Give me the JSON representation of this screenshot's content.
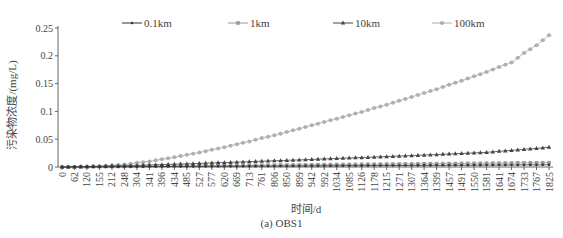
{
  "chart_data": {
    "type": "line",
    "title": "",
    "caption": "(a) OBS1",
    "xlabel": "时间/d",
    "ylabel": "污染物浓度/(mg/L)",
    "ylim": [
      0,
      0.25
    ],
    "yticks": [
      "0",
      "0.05",
      "0.1",
      "0.15",
      "0.2",
      "0.25"
    ],
    "grid": false,
    "legend_position": "top",
    "x": [
      "0",
      "62",
      "120",
      "155",
      "212",
      "248",
      "304",
      "341",
      "396",
      "434",
      "485",
      "527",
      "577",
      "620",
      "669",
      "713",
      "761",
      "806",
      "850",
      "899",
      "942",
      "992",
      "1034",
      "1085",
      "1126",
      "1178",
      "1215",
      "1271",
      "1307",
      "1364",
      "1399",
      "1457",
      "1491",
      "1550",
      "1581",
      "1641",
      "1674",
      "1733",
      "1767",
      "1825"
    ],
    "series": [
      {
        "name": "0.1km",
        "marker": "dot",
        "color": "#333333",
        "values": [
          0,
          0.0001,
          0.0002,
          0.0003,
          0.0004,
          0.0005,
          0.0006,
          0.0007,
          0.0008,
          0.0009,
          0.001,
          0.0011,
          0.0012,
          0.0013,
          0.0014,
          0.0015,
          0.0016,
          0.0017,
          0.0018,
          0.0019,
          0.002,
          0.0021,
          0.0022,
          0.0023,
          0.0024,
          0.0025,
          0.0026,
          0.0027,
          0.0028,
          0.0029,
          0.003,
          0.0031,
          0.0032,
          0.0033,
          0.0034,
          0.0035,
          0.0036,
          0.0037,
          0.0038,
          0.0039
        ]
      },
      {
        "name": "1km",
        "marker": "square",
        "color": "#999999",
        "values": [
          0,
          0.0002,
          0.0004,
          0.0006,
          0.0008,
          0.001,
          0.0012,
          0.0014,
          0.0016,
          0.0018,
          0.002,
          0.0022,
          0.0024,
          0.0026,
          0.0028,
          0.003,
          0.0032,
          0.0034,
          0.0036,
          0.0038,
          0.004,
          0.0042,
          0.0044,
          0.0046,
          0.0048,
          0.005,
          0.0052,
          0.0054,
          0.0056,
          0.0058,
          0.006,
          0.0062,
          0.0064,
          0.0066,
          0.0068,
          0.007,
          0.0072,
          0.0074,
          0.0076,
          0.0078
        ]
      },
      {
        "name": "10km",
        "marker": "triangle",
        "color": "#444444",
        "values": [
          0,
          0.0003,
          0.0008,
          0.0012,
          0.0018,
          0.0023,
          0.003,
          0.0036,
          0.0043,
          0.005,
          0.0058,
          0.0065,
          0.0073,
          0.008,
          0.0088,
          0.0096,
          0.0104,
          0.0112,
          0.012,
          0.0128,
          0.0136,
          0.0145,
          0.0153,
          0.0162,
          0.017,
          0.0179,
          0.0188,
          0.0197,
          0.0206,
          0.0215,
          0.0224,
          0.0234,
          0.0243,
          0.0253,
          0.0263,
          0.0283,
          0.0298,
          0.0318,
          0.0335,
          0.0355
        ]
      },
      {
        "name": "100km",
        "marker": "diamond",
        "color": "#b0b0b0",
        "values": [
          0,
          0.0002,
          0.0008,
          0.0015,
          0.003,
          0.0045,
          0.0075,
          0.01,
          0.014,
          0.0175,
          0.022,
          0.026,
          0.031,
          0.0355,
          0.041,
          0.046,
          0.052,
          0.057,
          0.063,
          0.069,
          0.075,
          0.081,
          0.087,
          0.093,
          0.099,
          0.106,
          0.112,
          0.119,
          0.126,
          0.133,
          0.14,
          0.148,
          0.155,
          0.163,
          0.171,
          0.18,
          0.188,
          0.205,
          0.219,
          0.237
        ]
      }
    ]
  }
}
